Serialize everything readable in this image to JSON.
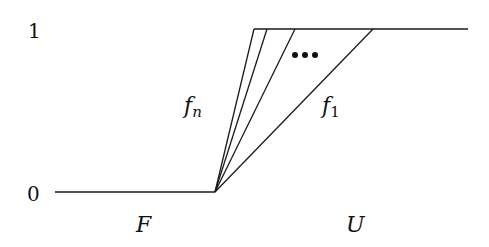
{
  "diagram": {
    "y_labels": {
      "top": "1",
      "bottom": "0"
    },
    "region_labels": {
      "left": "F",
      "right": "U"
    },
    "curves": [
      {
        "name": "f_n",
        "label_base": "f",
        "label_sub": "n",
        "top_x": 254
      },
      {
        "name": "f_2",
        "label_base": "",
        "label_sub": "",
        "top_x": 267
      },
      {
        "name": "f_3",
        "label_base": "",
        "label_sub": "",
        "top_x": 295
      },
      {
        "name": "f_1",
        "label_base": "f",
        "label_sub": "1",
        "top_x": 373
      }
    ],
    "ellipsis": "•••",
    "colors": {
      "line": "#1a1a1a",
      "background": "#ffffff"
    }
  }
}
